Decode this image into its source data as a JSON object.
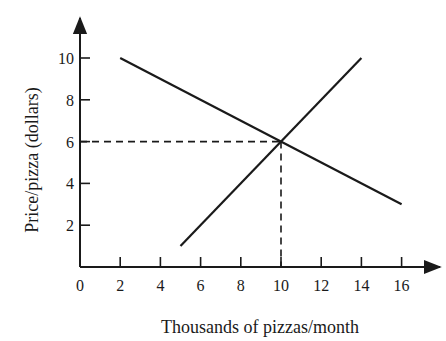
{
  "chart_data": {
    "type": "line",
    "title": "",
    "xlabel": "Thousands of pizzas/month",
    "ylabel": "Price/pizza (dollars)",
    "xlim": [
      0,
      18
    ],
    "ylim": [
      0,
      12
    ],
    "x_ticks": [
      0,
      2,
      4,
      6,
      8,
      10,
      12,
      14,
      16
    ],
    "y_ticks": [
      2,
      4,
      6,
      8,
      10
    ],
    "grid": false,
    "legend": null,
    "series": [
      {
        "name": "Demand",
        "points": [
          [
            2,
            10
          ],
          [
            16,
            3
          ]
        ],
        "style": "solid"
      },
      {
        "name": "Supply",
        "points": [
          [
            5,
            1
          ],
          [
            14,
            10
          ]
        ],
        "style": "solid"
      }
    ],
    "annotations": [
      {
        "type": "equilibrium",
        "x": 10,
        "y": 6,
        "guides": "dashed lines to both axes"
      }
    ]
  },
  "colors": {
    "ink": "#1a1a1a",
    "background": "#ffffff"
  }
}
